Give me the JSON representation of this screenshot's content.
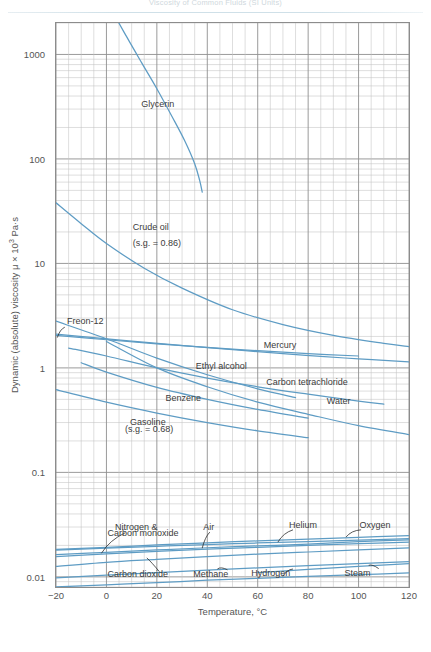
{
  "running_header": "Viscosity of Common Fluids (SI Units)",
  "chart_data": {
    "type": "line",
    "title": "",
    "xlabel": "Temperature, °C",
    "ylabel": "Dynamic (absolute) viscosity μ × 10³ Pa·s",
    "yscale": "log",
    "xlim": [
      -20,
      120
    ],
    "ylim": [
      0.008,
      2000
    ],
    "xticks": [
      -20,
      0,
      20,
      40,
      60,
      80,
      100,
      120
    ],
    "yticks": [
      0.01,
      0.1,
      1,
      10,
      100,
      1000
    ],
    "ytick_labels": [
      "0.01",
      "0.1",
      "1",
      "10",
      "100",
      "1000"
    ],
    "grid": true,
    "legend": "none (curves labeled inline)",
    "accent_color": "#5e9cc4",
    "grid_color": "#b9b9b9",
    "series": [
      {
        "name": "Glycerin",
        "label": "Glycerin",
        "x": [
          -3,
          2,
          8,
          14,
          20,
          26,
          31,
          35,
          37,
          38
        ],
        "y": [
          4800,
          2700,
          1480,
          830,
          470,
          255,
          150,
          90,
          62,
          48
        ]
      },
      {
        "name": "Crude oil (s.g. = 0.86)",
        "label": "Crude oil\n(s.g. = 0.86)",
        "x": [
          -20,
          -10,
          0,
          15,
          30,
          50,
          70,
          90,
          110,
          120
        ],
        "y": [
          38,
          24,
          15.5,
          9.0,
          5.8,
          3.6,
          2.6,
          2.05,
          1.72,
          1.6
        ]
      },
      {
        "name": "Freon-12",
        "label": "Freon-12",
        "x": [
          -20,
          -5,
          10,
          25,
          40,
          55,
          70,
          85,
          100,
          115,
          120
        ],
        "y": [
          2.1,
          1.95,
          1.8,
          1.68,
          1.56,
          1.46,
          1.37,
          1.29,
          1.22,
          1.16,
          1.14
        ]
      },
      {
        "name": "Mercury",
        "label": "Mercury",
        "x": [
          -20,
          0,
          20,
          40,
          60,
          80,
          100
        ],
        "y": [
          2.05,
          1.86,
          1.7,
          1.57,
          1.46,
          1.37,
          1.3
        ]
      },
      {
        "name": "Ethyl alcohol",
        "label": "Ethyl alcohol",
        "x": [
          -20,
          0,
          20,
          40,
          60,
          75
        ],
        "y": [
          2.8,
          1.9,
          1.24,
          0.86,
          0.63,
          0.52
        ]
      },
      {
        "name": "Carbon tetrachloride",
        "label": "Carbon tetrachloride",
        "x": [
          -15,
          0,
          20,
          40,
          60,
          80,
          100,
          110
        ],
        "y": [
          1.55,
          1.3,
          1.0,
          0.8,
          0.66,
          0.56,
          0.48,
          0.45
        ]
      },
      {
        "name": "Water",
        "label": "Water",
        "x": [
          0,
          20,
          40,
          60,
          80,
          100,
          120
        ],
        "y": [
          1.79,
          1.0,
          0.66,
          0.47,
          0.36,
          0.28,
          0.23
        ]
      },
      {
        "name": "Benzene",
        "label": "Benzene",
        "x": [
          -10,
          0,
          20,
          40,
          60,
          80
        ],
        "y": [
          1.12,
          0.91,
          0.65,
          0.5,
          0.4,
          0.33
        ]
      },
      {
        "name": "Gasoline (s.g. = 0.68)",
        "label": "Gasoline\n(s.g. = 0.68)",
        "x": [
          -20,
          0,
          20,
          40,
          60,
          80
        ],
        "y": [
          0.62,
          0.47,
          0.37,
          0.3,
          0.25,
          0.215
        ]
      },
      {
        "name": "Helium",
        "label": "Helium",
        "x": [
          -20,
          0,
          20,
          40,
          60,
          80,
          100,
          120
        ],
        "y": [
          0.018,
          0.0188,
          0.0196,
          0.0204,
          0.0211,
          0.0218,
          0.0225,
          0.0232
        ]
      },
      {
        "name": "Air",
        "label": "Air",
        "x": [
          -20,
          0,
          20,
          40,
          60,
          80,
          100,
          120
        ],
        "y": [
          0.0163,
          0.0172,
          0.0181,
          0.019,
          0.0198,
          0.0206,
          0.0218,
          0.0226
        ]
      },
      {
        "name": "Oxygen",
        "label": "Oxygen",
        "x": [
          -20,
          0,
          20,
          40,
          60,
          80,
          100,
          120
        ],
        "y": [
          0.0183,
          0.0192,
          0.0202,
          0.0212,
          0.0221,
          0.023,
          0.0239,
          0.0248
        ]
      },
      {
        "name": "Nitrogen & Carbon monoxide",
        "label": "Nitrogen &\nCarbon monoxide",
        "x": [
          -20,
          0,
          20,
          40,
          60,
          80,
          100,
          120
        ],
        "y": [
          0.0156,
          0.0166,
          0.0175,
          0.0184,
          0.0192,
          0.02,
          0.0208,
          0.0215
        ]
      },
      {
        "name": "Carbon dioxide",
        "label": "Carbon dioxide",
        "x": [
          -20,
          0,
          20,
          40,
          60,
          80,
          100,
          120
        ],
        "y": [
          0.0126,
          0.0138,
          0.0147,
          0.0156,
          0.0165,
          0.0173,
          0.0181,
          0.0189
        ]
      },
      {
        "name": "Steam",
        "label": "Steam",
        "x": [
          60,
          80,
          100,
          120
        ],
        "y": [
          0.011,
          0.0118,
          0.0126,
          0.0134
        ]
      },
      {
        "name": "Methane",
        "label": "Methane",
        "x": [
          -20,
          0,
          20,
          40,
          60,
          80,
          100,
          120
        ],
        "y": [
          0.0098,
          0.0104,
          0.011,
          0.0116,
          0.0122,
          0.0128,
          0.0134,
          0.014
        ]
      },
      {
        "name": "Hydrogen",
        "label": "Hydrogen",
        "x": [
          -20,
          0,
          20,
          40,
          60,
          80,
          100,
          120
        ],
        "y": [
          0.008,
          0.0084,
          0.0088,
          0.0093,
          0.0097,
          0.0101,
          0.0105,
          0.0109
        ]
      }
    ],
    "annotations": [
      {
        "text": "Glycerin",
        "x": 20,
        "y": 330,
        "align": "center"
      },
      {
        "text": "Crude oil",
        "x": 10,
        "y": 22,
        "align": "left"
      },
      {
        "text": "(s.g. = 0.86)",
        "x": 10,
        "y": 15.5,
        "align": "left"
      },
      {
        "text": "Freon-12",
        "x": -16,
        "y": 2.75,
        "align": "left"
      },
      {
        "text": "Mercury",
        "x": 62,
        "y": 1.62,
        "align": "left"
      },
      {
        "text": "Ethyl alcohol",
        "x": 35,
        "y": 1.02,
        "align": "left"
      },
      {
        "text": "Carbon tetrachloride",
        "x": 63,
        "y": 0.72,
        "align": "left"
      },
      {
        "text": "Water",
        "x": 87,
        "y": 0.47,
        "align": "left"
      },
      {
        "text": "Benzene",
        "x": 23,
        "y": 0.5,
        "align": "left"
      },
      {
        "text": "Gasoline",
        "x": 9,
        "y": 0.3,
        "align": "left"
      },
      {
        "text": "(s.g. = 0.68)",
        "x": 7,
        "y": 0.255,
        "align": "left"
      },
      {
        "text": "Nitrogen &",
        "x": 3,
        "y": 0.0295,
        "align": "left"
      },
      {
        "text": "Carbon monoxide",
        "x": 0,
        "y": 0.0255,
        "align": "left"
      },
      {
        "text": "Air",
        "x": 38,
        "y": 0.0295,
        "align": "left"
      },
      {
        "text": "Helium",
        "x": 72,
        "y": 0.031,
        "align": "left"
      },
      {
        "text": "Oxygen",
        "x": 100,
        "y": 0.031,
        "align": "left"
      },
      {
        "text": "Carbon dioxide",
        "x": 0,
        "y": 0.0104,
        "align": "left"
      },
      {
        "text": "Methane",
        "x": 34,
        "y": 0.0104,
        "align": "left"
      },
      {
        "text": "Hydrogen",
        "x": 57,
        "y": 0.0107,
        "align": "left"
      },
      {
        "text": "Steam",
        "x": 94,
        "y": 0.0107,
        "align": "left"
      }
    ],
    "leaders": [
      {
        "from_x": -16.5,
        "from_y": 2.45,
        "to_x": -19.5,
        "to_y": 1.95
      },
      {
        "from_x": 7.5,
        "from_y": 0.0265,
        "to_x": -2,
        "to_y": 0.0168
      },
      {
        "from_x": 41,
        "from_y": 0.0268,
        "to_x": 38,
        "to_y": 0.0188
      },
      {
        "from_x": 74,
        "from_y": 0.0282,
        "to_x": 68,
        "to_y": 0.0215
      },
      {
        "from_x": 101,
        "from_y": 0.0282,
        "to_x": 95,
        "to_y": 0.024
      },
      {
        "from_x": 21,
        "from_y": 0.0112,
        "to_x": 16,
        "to_y": 0.0152
      },
      {
        "from_x": 48,
        "from_y": 0.0117,
        "to_x": 44,
        "to_y": 0.0119
      },
      {
        "from_x": 74,
        "from_y": 0.0119,
        "to_x": 70,
        "to_y": 0.0101
      },
      {
        "from_x": 108,
        "from_y": 0.012,
        "to_x": 104,
        "to_y": 0.0129
      }
    ]
  }
}
